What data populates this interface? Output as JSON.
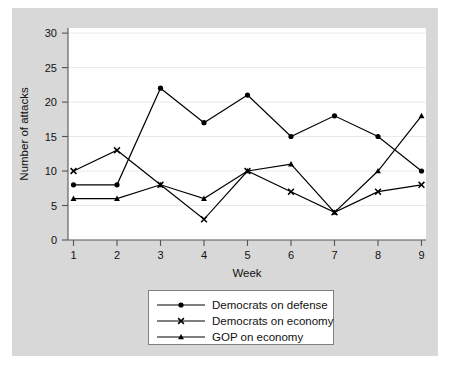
{
  "chart_data": {
    "type": "line",
    "title": "",
    "xlabel": "Week",
    "ylabel": "Number of attacks",
    "x": [
      1,
      2,
      3,
      4,
      5,
      6,
      7,
      8,
      9
    ],
    "xtick_labels": [
      "1",
      "2",
      "3",
      "4",
      "5",
      "6",
      "7",
      "8",
      "9"
    ],
    "ytick_labels": [
      "0",
      "5",
      "10",
      "15",
      "20",
      "25",
      "30"
    ],
    "yticks": [
      0,
      5,
      10,
      15,
      20,
      25,
      30
    ],
    "xlim": [
      0.6,
      9.4
    ],
    "ylim": [
      0,
      31
    ],
    "grid": "horizontal",
    "legend_position": "below-plot",
    "series": [
      {
        "name": "Democrats on defense",
        "marker": "circle",
        "color": "#000000",
        "values": [
          8,
          8,
          22,
          17,
          21,
          15,
          18,
          15,
          10
        ]
      },
      {
        "name": "Democrats on economy",
        "marker": "x",
        "color": "#000000",
        "values": [
          10,
          13,
          8,
          3,
          10,
          7,
          4,
          7,
          8
        ]
      },
      {
        "name": "GOP on economy",
        "marker": "triangle",
        "color": "#000000",
        "values": [
          6,
          6,
          8,
          6,
          10,
          11,
          4,
          10,
          18
        ]
      }
    ]
  },
  "colors": {
    "figure_background": "#d8d8d8",
    "plot_background": "#ffffff",
    "gridline": "#e8e8e8",
    "axis_line": "#555555",
    "series_line": "#000000",
    "legend_border": "#777777",
    "legend_background": "#ffffff"
  }
}
